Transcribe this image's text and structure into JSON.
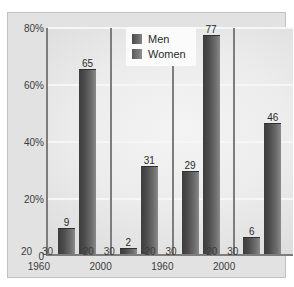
{
  "top_caption_fragment": "",
  "chart_data": {
    "type": "bar",
    "title": "",
    "xlabel": "Age",
    "ylabel": "",
    "ylim": [
      0,
      80
    ],
    "yticks": [
      "80%",
      "60%",
      "40%",
      "20%",
      "0"
    ],
    "ytick_values": [
      80,
      60,
      40,
      20,
      0
    ],
    "grid": true,
    "legend": {
      "position": "top-center",
      "entries": [
        {
          "name": "Men",
          "color": "#4a4a4a"
        },
        {
          "name": "Women",
          "color": "#6a6a6a"
        }
      ]
    },
    "axis_note": "Age",
    "groups": [
      {
        "series": "Men",
        "year": "1960",
        "ages": [
          "20",
          "30"
        ],
        "values": [
          9,
          65
        ]
      },
      {
        "series": "Men",
        "year": "2000",
        "ages": [
          "20",
          "30"
        ],
        "values": [
          2,
          31
        ]
      },
      {
        "series": "Women",
        "year": "1960",
        "ages": [
          "20",
          "30"
        ],
        "values": [
          29,
          77
        ]
      },
      {
        "series": "Women",
        "year": "2000",
        "ages": [
          "20",
          "30"
        ],
        "values": [
          6,
          46
        ]
      }
    ],
    "categories": [
      "20 / 1960",
      "30 / 1960",
      "20 / 2000",
      "30 / 2000",
      "20 / 1960",
      "30 / 1960",
      "20 / 2000",
      "30 / 2000"
    ],
    "values": [
      9,
      65,
      2,
      31,
      29,
      77,
      6,
      46
    ],
    "bar_labels": [
      "9",
      "65",
      "2",
      "31",
      "29",
      "77",
      "6",
      "46"
    ],
    "year_labels": [
      "1960",
      "2000",
      "1960",
      "2000"
    ],
    "age_labels": [
      "20",
      "30",
      "20",
      "30",
      "20",
      "30",
      "20",
      "30"
    ]
  }
}
